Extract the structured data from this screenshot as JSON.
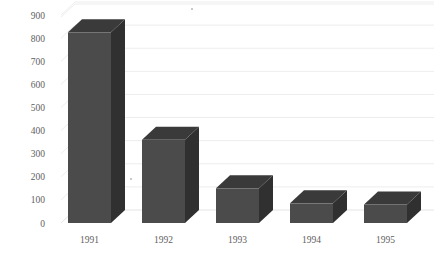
{
  "chart_data": {
    "type": "bar",
    "title": "",
    "subtitle": "",
    "xlabel": "",
    "ylabel": "",
    "categories": [
      "1991",
      "1992",
      "1993",
      "1994",
      "1995"
    ],
    "values": [
      825,
      360,
      150,
      85,
      80
    ],
    "series": [
      {
        "name": "",
        "values": [
          825,
          360,
          150,
          85,
          80
        ]
      }
    ],
    "ylim": [
      0,
      900
    ],
    "ytick_values": [
      0,
      100,
      200,
      300,
      400,
      500,
      600,
      700,
      800,
      900
    ],
    "ytick_labels": [
      "0",
      "100",
      "200",
      "300",
      "400",
      "500",
      "600",
      "700",
      "800",
      "900"
    ],
    "grid": true,
    "grid_axis": "y",
    "legend": false,
    "legend_position": "none",
    "style": "3d-column",
    "colors": {
      "bar_front": "#4b4b4b",
      "bar_side": "#303030",
      "bar_top": "#3a3a3a",
      "gridline": "#ededed",
      "tick_text": "#5e5e5e",
      "background": "#ffffff"
    }
  },
  "axes": {
    "y": {
      "labels": [
        "900",
        "800",
        "700",
        "600",
        "500",
        "400",
        "300",
        "200",
        "100",
        "0"
      ]
    },
    "x": {
      "labels": [
        "1991",
        "1992",
        "1993",
        "1994",
        "1995"
      ]
    }
  }
}
